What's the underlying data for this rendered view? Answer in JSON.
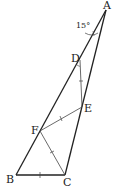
{
  "diagram": {
    "type": "geometry-triangle",
    "points": {
      "A": {
        "label": "A"
      },
      "B": {
        "label": "B"
      },
      "C": {
        "label": "C"
      },
      "D": {
        "label": "D"
      },
      "E": {
        "label": "E"
      },
      "F": {
        "label": "F"
      }
    },
    "angle_label": "15°",
    "segments": [
      "AB",
      "AC",
      "BC",
      "DE",
      "EF",
      "FC"
    ],
    "equal_marks": [
      "DE",
      "EF",
      "FC",
      "BC"
    ]
  }
}
